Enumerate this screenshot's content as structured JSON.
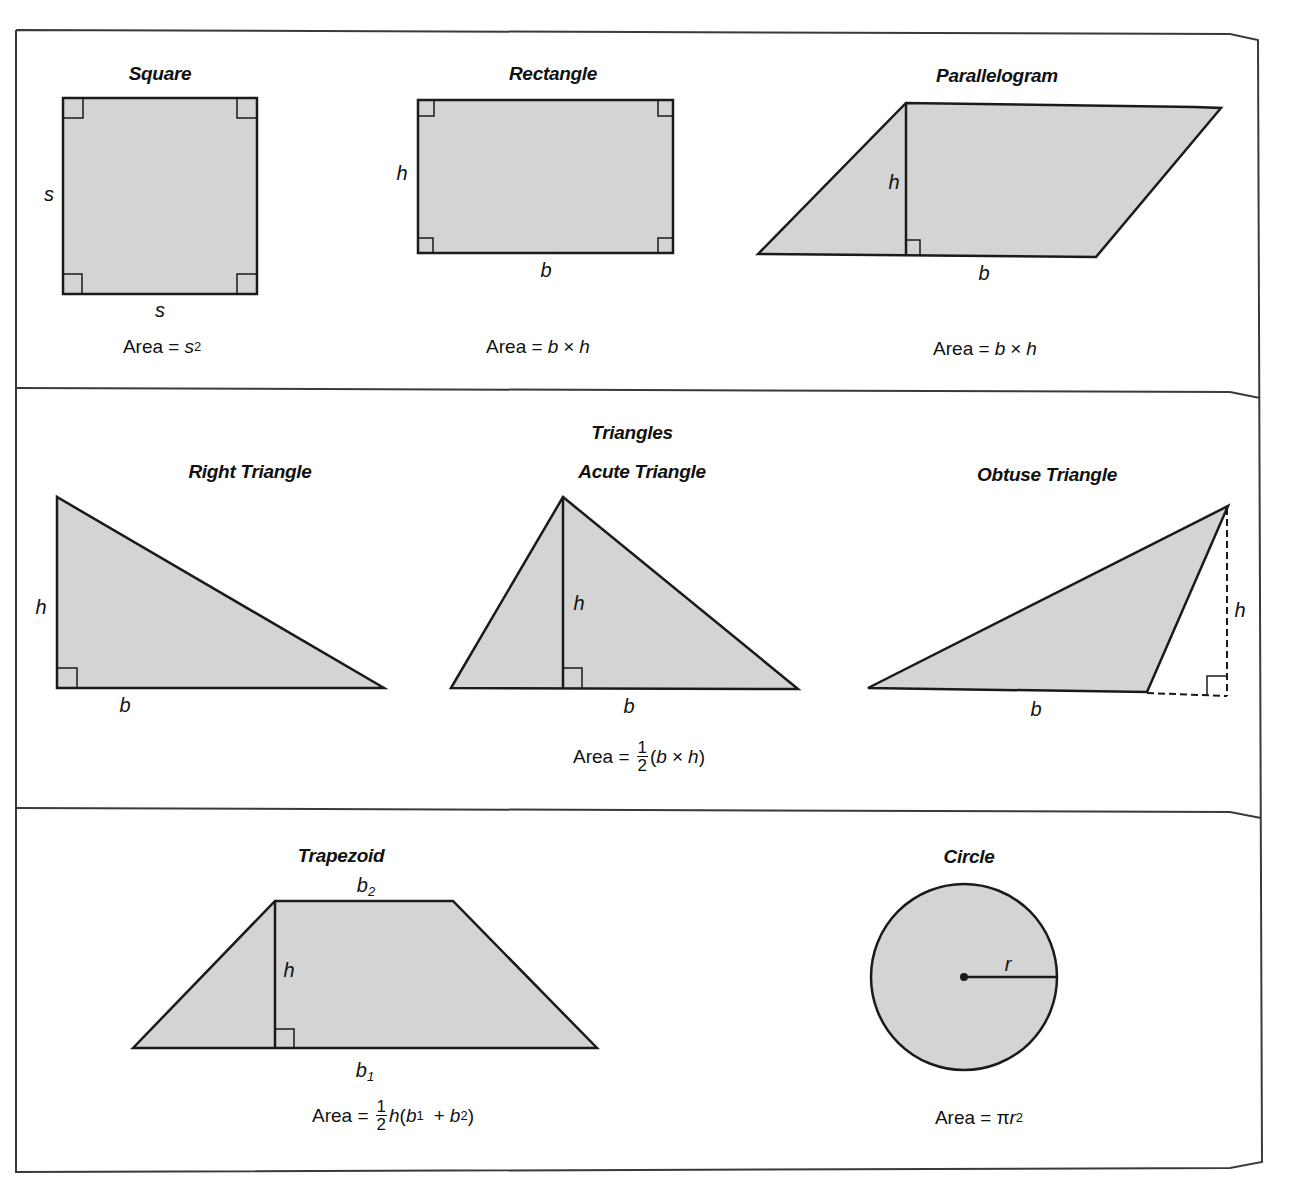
{
  "colors": {
    "shape_fill": "#d4d4d4",
    "stroke": "#1a1a1a",
    "frame": "#3a3a3a",
    "background": "#ffffff"
  },
  "sections": {
    "quadrilaterals": {
      "square": {
        "title": "Square",
        "side_label_left": "s",
        "side_label_bottom": "s",
        "formula": {
          "prefix": "Area =",
          "var": "s",
          "exponent": "2"
        }
      },
      "rectangle": {
        "title": "Rectangle",
        "height_label": "h",
        "base_label": "b",
        "formula": {
          "prefix": "Area =",
          "a": "b",
          "op": "×",
          "b": "h"
        }
      },
      "parallelogram": {
        "title": "Parallelogram",
        "height_label": "h",
        "base_label": "b",
        "formula": {
          "prefix": "Area =",
          "a": "b",
          "op": "×",
          "b": "h"
        }
      }
    },
    "triangles": {
      "heading": "Triangles",
      "right": {
        "title": "Right Triangle",
        "height_label": "h",
        "base_label": "b"
      },
      "acute": {
        "title": "Acute Triangle",
        "height_label": "h",
        "base_label": "b"
      },
      "obtuse": {
        "title": "Obtuse Triangle",
        "height_label": "h",
        "base_label": "b"
      },
      "formula": {
        "prefix": "Area =",
        "frac_num": "1",
        "frac_den": "2",
        "open": "(",
        "a": "b",
        "op": "×",
        "b": "h",
        "close": ")"
      }
    },
    "others": {
      "trapezoid": {
        "title": "Trapezoid",
        "top_base_label": "b",
        "top_base_sub": "2",
        "bottom_base_label": "b",
        "bottom_base_sub": "1",
        "height_label": "h",
        "formula": {
          "prefix": "Area =",
          "frac_num": "1",
          "frac_den": "2",
          "h": "h",
          "open": "(",
          "b1": "b",
          "b1_sub": "1",
          "plus": "+",
          "b2": "b",
          "b2_sub": "2",
          "close": ")"
        }
      },
      "circle": {
        "title": "Circle",
        "radius_label": "r",
        "formula": {
          "prefix": "Area =",
          "pi": "π",
          "var": "r",
          "exponent": "2"
        }
      }
    }
  }
}
